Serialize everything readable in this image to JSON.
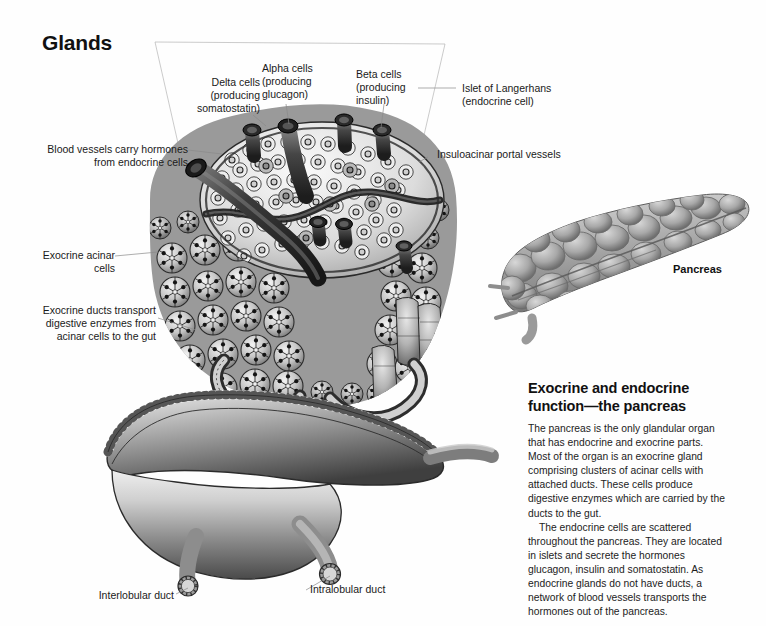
{
  "page": {
    "title": "Glands",
    "background": "#ffffff",
    "ink": "#1a1a1a",
    "leader_color": "#8a8a8a",
    "frame_color": "#b4b4b4"
  },
  "callouts": [
    {
      "id": "delta-cells",
      "text": "Delta cells\n(producing\nsomatostatin)",
      "align": "right"
    },
    {
      "id": "alpha-cells",
      "text": "Alpha cells\n(producing\nglucagon)",
      "align": "left"
    },
    {
      "id": "beta-cells",
      "text": "Beta cells\n(producing\ninsulin)",
      "align": "left"
    },
    {
      "id": "islet-of-langerhans",
      "text": "Islet of Langerhans\n(endocrine cell)",
      "align": "left"
    },
    {
      "id": "insuloacinar",
      "text": "Insuloacinar portal vessels",
      "align": "left"
    },
    {
      "id": "blood-vessels",
      "text": "Blood vessels carry hormones\nfrom endocrine cells",
      "align": "right"
    },
    {
      "id": "exocrine-acinar",
      "text": "Exocrine acinar cells",
      "align": "right"
    },
    {
      "id": "exocrine-ducts",
      "text": "Exocrine ducts transport\ndigestive enzymes from\nacinar cells to the gut",
      "align": "right"
    },
    {
      "id": "interlobular-duct",
      "text": "Interlobular duct",
      "align": "right"
    },
    {
      "id": "intralobular-duct",
      "text": "Intralobular duct",
      "align": "left"
    }
  ],
  "organ": {
    "label": "Pancreas"
  },
  "article": {
    "heading": "Exocrine and endocrine function—the pancreas",
    "paragraph_1": "The pancreas is the only glandular organ that has endocrine and exocrine parts. Most of the organ is an exocrine gland comprising clusters of acinar cells with attached ducts. These cells produce digestive enzymes which are carried by the ducts to the gut.",
    "paragraph_2": "The endocrine cells are scattered throughout the pancreas. They are located in islets and secrete the hormones glucagon, insulin and somatostatin. As endocrine glands do not have ducts, a network of blood vessels transports the hormones out of the pancreas."
  }
}
